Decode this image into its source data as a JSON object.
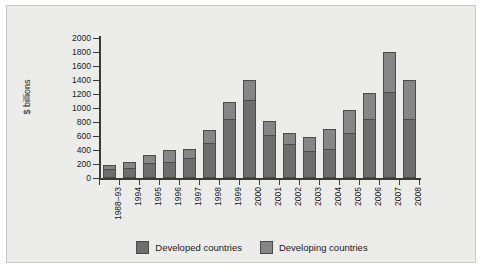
{
  "chart_data": {
    "type": "bar",
    "subtype": "stacked-bar",
    "title": "",
    "xlabel": "",
    "ylabel": "$ billions",
    "ylim": [
      0,
      2000
    ],
    "yticks": [
      0,
      200,
      400,
      600,
      800,
      1000,
      1200,
      1400,
      1600,
      1800,
      2000
    ],
    "grid": false,
    "legend_position": "bottom-center",
    "categories": [
      "1988–93",
      "1994",
      "1995",
      "1996",
      "1997",
      "1998",
      "1999",
      "2000",
      "2001",
      "2002",
      "2003",
      "2004",
      "2005",
      "2006",
      "2007",
      "2008"
    ],
    "series": [
      {
        "name": "Developed countries",
        "color": "#6e6e6e",
        "values": [
          130,
          150,
          220,
          230,
          280,
          500,
          850,
          1120,
          620,
          480,
          390,
          420,
          640,
          850,
          1230,
          850
        ]
      },
      {
        "name": "Developing countries",
        "color": "#878787",
        "values": [
          50,
          80,
          110,
          170,
          140,
          190,
          240,
          280,
          200,
          170,
          190,
          280,
          330,
          370,
          570,
          550
        ]
      }
    ],
    "totals": [
      180,
      230,
      330,
      400,
      420,
      690,
      1090,
      1400,
      820,
      650,
      580,
      700,
      970,
      1220,
      1800,
      1400
    ]
  },
  "legend": {
    "items": [
      {
        "label": "Developed countries",
        "swatch": "developed"
      },
      {
        "label": "Developing countries",
        "swatch": "developing"
      }
    ]
  },
  "axis": {
    "y_title": "$ billions"
  }
}
